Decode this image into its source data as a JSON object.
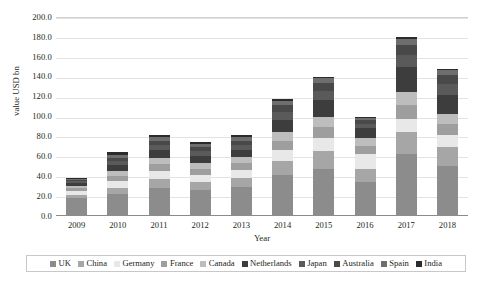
{
  "chart_data": {
    "type": "bar",
    "subtype": "stacked-bar",
    "title": "",
    "xlabel": "Year",
    "ylabel": "value USD bn",
    "categories": [
      "2009",
      "2010",
      "2011",
      "2012",
      "2013",
      "2014",
      "2015",
      "2016",
      "2017",
      "2018"
    ],
    "ylim": [
      0.0,
      200.0
    ],
    "ytick_step": 20.0,
    "ytick_labels": [
      "0.0",
      "20.0",
      "40.0",
      "60.0",
      "80.0",
      "100.0",
      "120.0",
      "140.0",
      "160.0",
      "180.0",
      "200.0"
    ],
    "ytick_values": [
      0.0,
      20.0,
      40.0,
      60.0,
      80.0,
      100.0,
      120.0,
      140.0,
      160.0,
      180.0,
      200.0
    ],
    "grid": true,
    "grid_axis": "y",
    "legend_position": "bottom",
    "series": [
      {
        "name": "UK",
        "color": "#8c8c8c",
        "values": [
          18.0,
          22.0,
          28.0,
          26.0,
          29.0,
          41.0,
          47.0,
          34.0,
          62.0,
          50.0
        ]
      },
      {
        "name": "China",
        "color": "#a6a6a6",
        "values": [
          3.0,
          6.0,
          9.0,
          8.0,
          9.0,
          14.0,
          18.0,
          13.0,
          22.0,
          19.0
        ]
      },
      {
        "name": "Germany",
        "color": "#e8e8e8",
        "values": [
          4.0,
          7.0,
          8.0,
          7.0,
          8.0,
          11.0,
          13.0,
          15.0,
          14.0,
          12.0
        ]
      },
      {
        "name": "France",
        "color": "#9e9e9e",
        "values": [
          3.0,
          5.0,
          7.0,
          6.0,
          7.0,
          9.0,
          11.0,
          8.0,
          14.0,
          11.0
        ]
      },
      {
        "name": "Canada",
        "color": "#bdbdbd",
        "values": [
          2.0,
          5.0,
          6.0,
          6.0,
          6.0,
          9.0,
          11.0,
          8.0,
          13.0,
          11.0
        ]
      },
      {
        "name": "Netherlands",
        "color": "#3d3d3d",
        "values": [
          3.0,
          6.0,
          8.0,
          7.0,
          7.0,
          13.0,
          17.0,
          10.0,
          25.0,
          19.0
        ]
      },
      {
        "name": "Japan",
        "color": "#5a5a5a",
        "values": [
          2.0,
          4.0,
          5.0,
          5.0,
          5.0,
          8.0,
          9.0,
          5.0,
          12.0,
          11.0
        ]
      },
      {
        "name": "Australia",
        "color": "#494949",
        "values": [
          1.5,
          3.5,
          4.5,
          4.0,
          4.5,
          6.5,
          7.5,
          4.0,
          10.0,
          8.5
        ]
      },
      {
        "name": "Spain",
        "color": "#6e6e6e",
        "values": [
          1.0,
          3.0,
          3.5,
          3.0,
          3.5,
          4.5,
          5.0,
          2.0,
          6.0,
          5.0
        ]
      },
      {
        "name": "India",
        "color": "#2b2b2b",
        "values": [
          0.5,
          2.5,
          2.0,
          2.0,
          2.0,
          2.0,
          1.5,
          1.0,
          2.0,
          1.5
        ]
      }
    ],
    "totals": [
      38.0,
      64.0,
      81.0,
      74.0,
      81.0,
      118.0,
      140.0,
      100.0,
      180.0,
      148.0
    ]
  }
}
